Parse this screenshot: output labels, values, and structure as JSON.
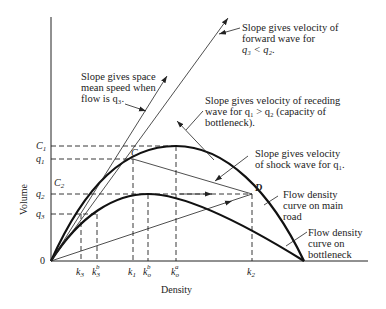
{
  "diagram": {
    "axes": {
      "x_label": "Density",
      "y_label": "Volume",
      "origin_label": "0"
    },
    "y_ticks": [
      {
        "id": "C1",
        "base": "C",
        "sub": "1"
      },
      {
        "id": "q1",
        "base": "q",
        "sub": "1"
      },
      {
        "id": "C2",
        "base": "C",
        "sub": "2"
      },
      {
        "id": "q2",
        "base": "q",
        "sub": "2"
      },
      {
        "id": "q3",
        "base": "q",
        "sub": "3"
      }
    ],
    "x_ticks": [
      {
        "id": "k3",
        "base": "k",
        "sub": "3",
        "sup": ""
      },
      {
        "id": "k3b",
        "base": "k",
        "sub": "3",
        "sup": "b"
      },
      {
        "id": "k1",
        "base": "k",
        "sub": "1",
        "sup": ""
      },
      {
        "id": "kob",
        "base": "k",
        "sub": "o",
        "sup": "b"
      },
      {
        "id": "koa",
        "base": "k",
        "sub": "o",
        "sup": "a"
      },
      {
        "id": "k2",
        "base": "k",
        "sub": "2",
        "sup": ""
      }
    ],
    "points": {
      "C": "C",
      "D": "D"
    },
    "curves": {
      "main_road": "Flow density curve on main road",
      "bottleneck": "Flow density curve on bottleneck"
    },
    "annotations": {
      "forward_wave": [
        "Slope gives velocity of",
        "forward wave for",
        "q₃ < q₂."
      ],
      "space_mean_speed": [
        "Slope gives space",
        "mean speed when",
        "flow is q₃."
      ],
      "receding_wave": [
        "Slope gives velocity of receding",
        "wave for q₁ > q₂ (capacity of",
        "bottleneck)."
      ],
      "shock_wave": [
        "Slope gives velocity",
        "of shock wave for q₁."
      ],
      "main_road_curve": [
        "Flow density",
        "curve on main",
        "road"
      ],
      "bottleneck_curve": [
        "Flow density",
        "curve on",
        "bottleneck"
      ]
    }
  }
}
